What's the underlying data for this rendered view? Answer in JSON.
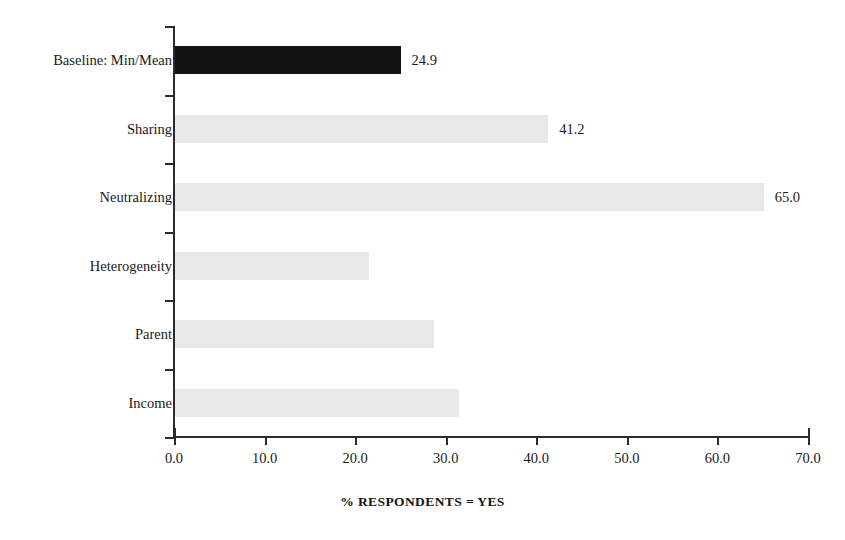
{
  "chart_data": {
    "type": "bar",
    "orientation": "horizontal",
    "title": "",
    "xlabel": "% RESPONDENTS = YES",
    "ylabel": "",
    "xlim": [
      0.0,
      70.0
    ],
    "xticks": [
      "0.0",
      "10.0",
      "20.0",
      "30.0",
      "40.0",
      "50.0",
      "60.0",
      "70.0"
    ],
    "xtick_values": [
      0,
      10,
      20,
      30,
      40,
      50,
      60,
      70
    ],
    "grid": false,
    "legend": false,
    "categories": [
      "Baseline: Min/Mean",
      "Sharing",
      "Neutralizing",
      "Heterogeneity",
      "Parent",
      "Income"
    ],
    "values": [
      24.9,
      41.2,
      65.0,
      21.4,
      28.6,
      31.4
    ],
    "value_labels": [
      "24.9",
      "41.2",
      "65.0",
      "",
      "",
      ""
    ],
    "bar_colors": [
      "#111111",
      "#e9e9e9",
      "#e9e9e9",
      "#e9e9e9",
      "#e9e9e9",
      "#e9e9e9"
    ],
    "bars": [
      {
        "label": "Baseline: Min/Mean",
        "value": 24.9,
        "value_label": "24.9",
        "style": "dark"
      },
      {
        "label": "Sharing",
        "value": 41.2,
        "value_label": "41.2",
        "style": "light"
      },
      {
        "label": "Neutralizing",
        "value": 65.0,
        "value_label": "65.0",
        "style": "light"
      },
      {
        "label": "Heterogeneity",
        "value": 21.4,
        "value_label": "",
        "style": "light"
      },
      {
        "label": "Parent",
        "value": 28.6,
        "value_label": "",
        "style": "light"
      },
      {
        "label": "Income",
        "value": 31.4,
        "value_label": "",
        "style": "light"
      }
    ]
  },
  "axis": {
    "x_title": "% RESPONDENTS = YES",
    "tick_0": "0.0",
    "tick_1": "10.0",
    "tick_2": "20.0",
    "tick_3": "30.0",
    "tick_4": "40.0",
    "tick_5": "50.0",
    "tick_6": "60.0",
    "tick_7": "70.0"
  },
  "colors": {
    "bar_highlight": "#111111",
    "bar_default": "#e9e9e9",
    "axis": "#2b2b2b",
    "text": "#1a1a1a",
    "background": "#ffffff"
  }
}
